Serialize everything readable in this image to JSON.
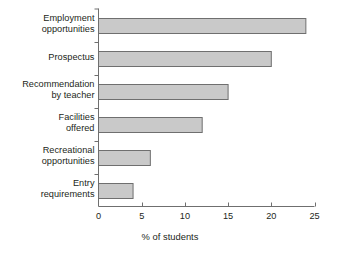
{
  "chart_data": {
    "type": "bar",
    "orientation": "horizontal",
    "title": "",
    "xlabel": "% of students",
    "ylabel": "",
    "categories": [
      "Employment\nopportunities",
      "Prospectus",
      "Recommendation\nby teacher",
      "Facilities\noffered",
      "Recreational\nopportunities",
      "Entry\nrequirements"
    ],
    "values": [
      24,
      20,
      15,
      12,
      6,
      4
    ],
    "xlim": [
      0,
      25
    ],
    "xticks": [
      0,
      5,
      10,
      15,
      20,
      25
    ],
    "xtick_labels": [
      "0",
      "5",
      "10",
      "15",
      "20",
      "25"
    ],
    "grid": false,
    "legend": null,
    "bar_fill_color": "#c9c9c9",
    "bar_border_color": "#6f6f6f",
    "axis_color": "#6f6f6f",
    "text_color": "#231f20",
    "background_color": "#ffffff"
  }
}
